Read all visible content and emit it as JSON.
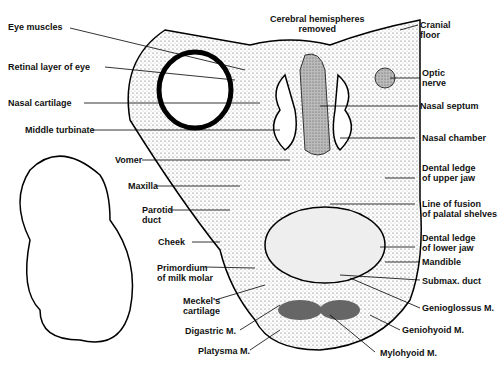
{
  "title": {
    "line1": "Cerebral hemispheres",
    "line2": "removed"
  },
  "labels_left": [
    {
      "id": "eye-muscles",
      "text": "Eye muscles"
    },
    {
      "id": "retinal-layer",
      "text": "Retinal layer of eye"
    },
    {
      "id": "nasal-cartilage",
      "text": "Nasal cartilage"
    },
    {
      "id": "middle-turbinate",
      "text": "Middle turbinate"
    },
    {
      "id": "vomer",
      "text": "Vomer"
    },
    {
      "id": "maxilla",
      "text": "Maxilla"
    },
    {
      "id": "parotid-duct",
      "text": "Parotid",
      "text2": "duct"
    },
    {
      "id": "cheek",
      "text": "Cheek"
    },
    {
      "id": "milk-molar",
      "text": "Primordium",
      "text2": "of milk molar"
    },
    {
      "id": "meckels",
      "text": "Meckel's",
      "text2": "cartilage"
    },
    {
      "id": "digastric",
      "text": "Digastric M."
    },
    {
      "id": "platysma",
      "text": "Platysma M."
    }
  ],
  "labels_right": [
    {
      "id": "cranial-floor",
      "text": "Cranial",
      "text2": "floor"
    },
    {
      "id": "optic-nerve",
      "text": "Optic",
      "text2": "nerve"
    },
    {
      "id": "nasal-septum",
      "text": "Nasal septum"
    },
    {
      "id": "nasal-chamber",
      "text": "Nasal chamber"
    },
    {
      "id": "dental-upper",
      "text": "Dental ledge",
      "text2": "of upper jaw"
    },
    {
      "id": "line-fusion",
      "text": "Line of fusion",
      "text2": "of palatal shelves"
    },
    {
      "id": "dental-lower",
      "text": "Dental ledge",
      "text2": "of lower jaw"
    },
    {
      "id": "mandible",
      "text": "Mandible"
    },
    {
      "id": "submax",
      "text": "Submax. duct"
    },
    {
      "id": "genioglossus",
      "text": "Genioglossus M."
    },
    {
      "id": "geniohyoid",
      "text": "Geniohyoid M."
    },
    {
      "id": "mylohyoid",
      "text": "Mylohyoid M."
    }
  ]
}
